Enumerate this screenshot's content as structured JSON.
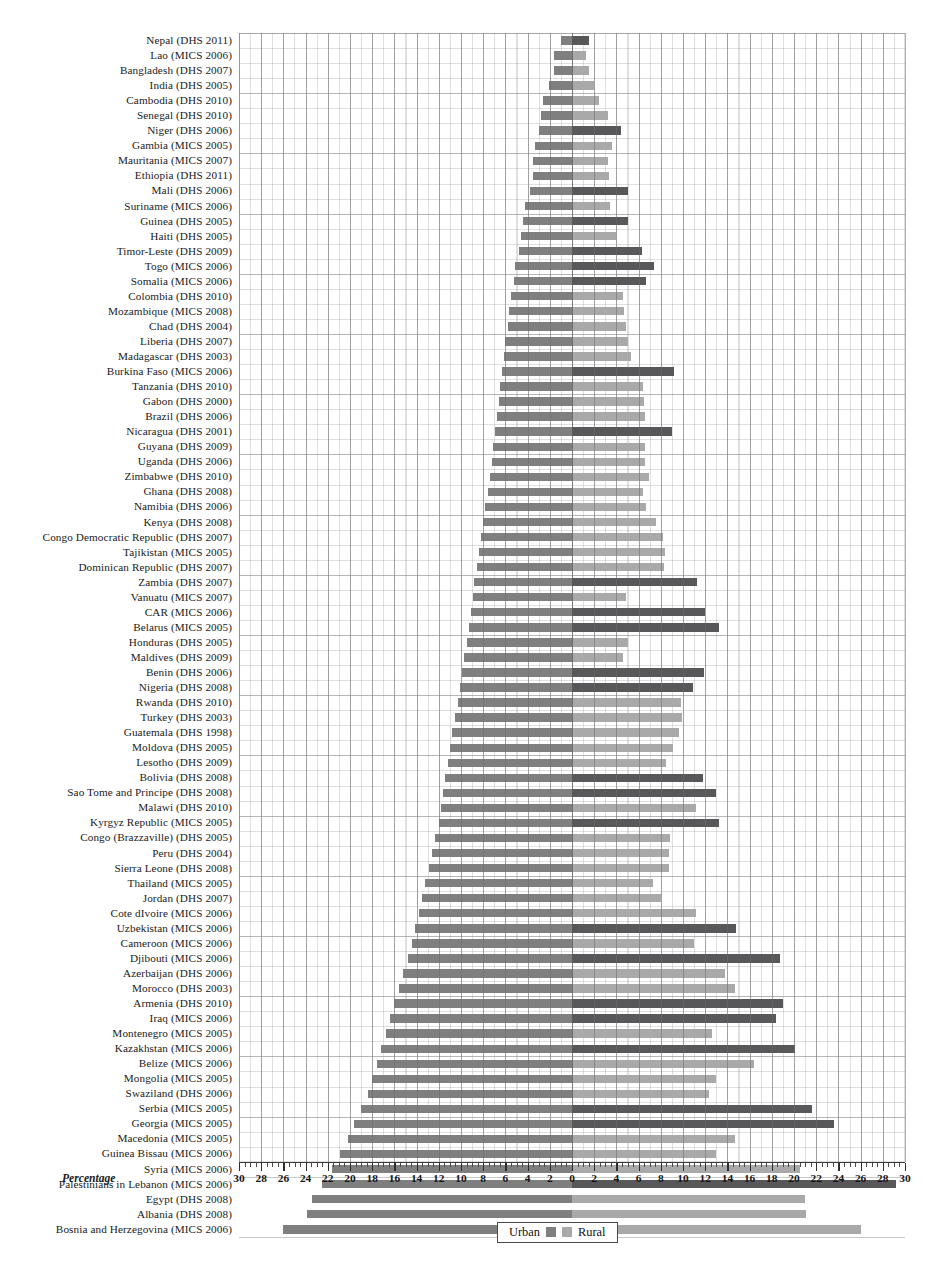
{
  "chart_data": {
    "type": "bar",
    "title": "",
    "subtitle": "",
    "orientation": "horizontal-diverging",
    "xlabel": "Percentage",
    "ylabel": "",
    "xlim": [
      -30,
      30
    ],
    "axis_ticks": [
      30,
      28,
      26,
      24,
      22,
      20,
      18,
      16,
      14,
      12,
      10,
      8,
      6,
      4,
      2,
      0,
      2,
      4,
      6,
      8,
      10,
      12,
      14,
      16,
      18,
      20,
      22,
      24,
      26,
      28,
      30
    ],
    "grid": true,
    "legend": {
      "position": "bottom-center",
      "entries": [
        {
          "name": "Urban",
          "color": "#7f7f7f"
        },
        {
          "name": "Rural",
          "color": "#a9a9a9"
        }
      ]
    },
    "note": "Left side of zero = Urban (plotted leftward); right side of zero = Rural. Rural bars are drawn in two tones in the scan: a darker tone for some surveys and a lighter tone for others.",
    "colors": {
      "urban": "#7f7f7f",
      "rural_light": "#a9a9a9",
      "rural_dark": "#58585a",
      "grid": "#969696",
      "axis": "#2e2e2e",
      "text": "#151515",
      "background": "#ffffff"
    },
    "categories": [
      "Nepal (DHS 2011)",
      "Lao (MICS 2006)",
      "Bangladesh (DHS 2007)",
      "India (DHS 2005)",
      "Cambodia (DHS 2010)",
      "Senegal (DHS 2010)",
      "Niger (DHS 2006)",
      "Gambia (MICS 2005)",
      "Mauritania (MICS 2007)",
      "Ethiopia (DHS 2011)",
      "Mali (DHS 2006)",
      "Suriname (MICS 2006)",
      "Guinea (DHS 2005)",
      "Haiti (DHS 2005)",
      "Timor-Leste (DHS 2009)",
      "Togo (MICS 2006)",
      "Somalia (MICS 2006)",
      "Colombia (DHS 2010)",
      "Mozambique (MICS 2008)",
      "Chad (DHS 2004)",
      "Liberia (DHS 2007)",
      "Madagascar (DHS 2003)",
      "Burkina Faso (MICS 2006)",
      "Tanzania (DHS 2010)",
      "Gabon (DHS 2000)",
      "Brazil (DHS 2006)",
      "Nicaragua (DHS 2001)",
      "Guyana (DHS 2009)",
      "Uganda (DHS 2006)",
      "Zimbabwe (DHS 2010)",
      "Ghana (DHS 2008)",
      "Namibia (DHS 2006)",
      "Kenya (DHS 2008)",
      "Congo Democratic Republic (DHS 2007)",
      "Tajikistan (MICS 2005)",
      "Dominican Republic (DHS 2007)",
      "Zambia (DHS 2007)",
      "Vanuatu (MICS 2007)",
      "CAR (MICS 2006)",
      "Belarus (MICS 2005)",
      "Honduras (DHS 2005)",
      "Maldives (DHS 2009)",
      "Benin (DHS 2006)",
      "Nigeria (DHS 2008)",
      "Rwanda (DHS 2010)",
      "Turkey (DHS 2003)",
      "Guatemala (DHS 1998)",
      "Moldova (DHS 2005)",
      "Lesotho (DHS 2009)",
      "Bolivia (DHS 2008)",
      "Sao Tome and Principe (DHS 2008)",
      "Malawi (DHS 2010)",
      "Kyrgyz Republic (MICS 2005)",
      "Congo (Brazzaville) (DHS 2005)",
      "Peru (DHS 2004)",
      "Sierra Leone (DHS 2008)",
      "Thailand (MICS 2005)",
      "Jordan (DHS 2007)",
      "Cote dIvoire (MICS 2006)",
      "Uzbekistan (MICS 2006)",
      "Cameroon (MICS 2006)",
      "Djibouti (MICS 2006)",
      "Azerbaijan (DHS 2006)",
      "Morocco (DHS 2003)",
      "Armenia (DHS 2010)",
      "Iraq (MICS 2006)",
      "Montenegro (MICS 2005)",
      "Kazakhstan (MICS 2006)",
      "Belize (MICS 2006)",
      "Mongolia (MICS 2005)",
      "Swaziland (DHS 2006)",
      "Serbia (MICS 2005)",
      "Georgia (MICS 2005)",
      "Macedonia (MICS 2005)",
      "Guinea Bissau (MICS 2006)",
      "Syria (MICS 2006)",
      "Palestinians in Lebanon (MICS 2006)",
      "Egypt (DHS 2008)",
      "Albania (DHS 2008)",
      "Bosnia and Herzegovina (MICS 2006)"
    ],
    "series": [
      {
        "name": "Urban",
        "color": "#7f7f7f",
        "values": [
          1.0,
          1.6,
          1.6,
          2.1,
          2.6,
          2.8,
          3.0,
          3.3,
          3.5,
          3.5,
          3.8,
          4.2,
          4.4,
          4.6,
          4.8,
          5.1,
          5.2,
          5.5,
          5.7,
          5.8,
          6.0,
          6.1,
          6.3,
          6.5,
          6.6,
          6.8,
          6.9,
          7.1,
          7.2,
          7.4,
          7.6,
          7.8,
          8.0,
          8.2,
          8.4,
          8.6,
          8.8,
          8.9,
          9.1,
          9.3,
          9.5,
          9.7,
          9.9,
          10.1,
          10.3,
          10.5,
          10.8,
          11.0,
          11.2,
          11.4,
          11.6,
          11.8,
          12.0,
          12.3,
          12.6,
          12.9,
          13.2,
          13.5,
          13.8,
          14.1,
          14.4,
          14.8,
          15.2,
          15.6,
          16.0,
          16.4,
          16.8,
          17.2,
          17.6,
          18.0,
          18.4,
          19.0,
          19.6,
          20.2,
          20.9,
          21.6,
          22.5,
          23.4,
          23.9,
          26.0
        ]
      },
      {
        "name": "Rural",
        "color": "#a9a9a9",
        "values": [
          1.5,
          1.3,
          1.5,
          2.0,
          2.4,
          3.2,
          4.4,
          3.6,
          3.2,
          3.3,
          5.0,
          3.4,
          5.0,
          4.0,
          6.3,
          7.4,
          6.7,
          4.6,
          4.7,
          4.9,
          5.0,
          5.3,
          9.2,
          6.4,
          6.5,
          6.6,
          9.0,
          6.6,
          6.6,
          6.9,
          6.4,
          6.7,
          7.6,
          8.2,
          8.4,
          8.3,
          11.3,
          4.9,
          12.0,
          13.2,
          5.0,
          4.6,
          11.9,
          10.9,
          9.8,
          9.9,
          9.6,
          9.1,
          8.5,
          11.8,
          13.0,
          11.2,
          13.2,
          8.8,
          8.7,
          8.7,
          7.3,
          8.0,
          11.2,
          14.8,
          11.0,
          18.7,
          13.8,
          14.7,
          19.0,
          18.4,
          12.6,
          20.1,
          16.4,
          13.0,
          12.3,
          21.6,
          23.6,
          14.7,
          13.0,
          20.5,
          29.2,
          21.0,
          21.1,
          26.0
        ]
      }
    ],
    "rural_tone": [
      "dark",
      "light",
      "light",
      "light",
      "light",
      "light",
      "dark",
      "light",
      "light",
      "light",
      "dark",
      "light",
      "dark",
      "light",
      "dark",
      "dark",
      "dark",
      "light",
      "light",
      "light",
      "light",
      "light",
      "dark",
      "light",
      "light",
      "light",
      "dark",
      "light",
      "light",
      "light",
      "light",
      "light",
      "light",
      "light",
      "light",
      "light",
      "dark",
      "light",
      "dark",
      "dark",
      "light",
      "light",
      "dark",
      "dark",
      "light",
      "light",
      "light",
      "light",
      "light",
      "dark",
      "dark",
      "light",
      "dark",
      "light",
      "light",
      "light",
      "light",
      "light",
      "light",
      "dark",
      "light",
      "dark",
      "light",
      "light",
      "dark",
      "dark",
      "light",
      "dark",
      "light",
      "light",
      "light",
      "dark",
      "dark",
      "light",
      "light",
      "light",
      "dark",
      "light",
      "light",
      "light"
    ]
  },
  "axis": {
    "title": "Percentage",
    "labels": [
      "30",
      "28",
      "26",
      "24",
      "22",
      "20",
      "18",
      "16",
      "14",
      "12",
      "10",
      "8",
      "6",
      "4",
      "2",
      "0",
      "2",
      "4",
      "6",
      "8",
      "10",
      "12",
      "14",
      "16",
      "18",
      "20",
      "22",
      "24",
      "26",
      "28",
      "30"
    ]
  },
  "legend": {
    "urban_label": "Urban",
    "rural_label": "Rural"
  }
}
